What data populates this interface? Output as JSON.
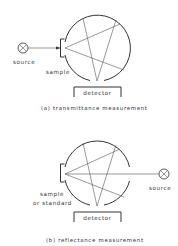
{
  "figure": {
    "panel_a": {
      "source_label": "source",
      "sample_label": "sample",
      "detector_label": "detector",
      "caption": "(a) transmittance measurement"
    },
    "panel_b": {
      "source_label": "source",
      "sample_label_line1": "sample",
      "sample_label_line2": "or standard",
      "detector_label": "detector",
      "caption": "(b) reflectance measurement"
    }
  }
}
